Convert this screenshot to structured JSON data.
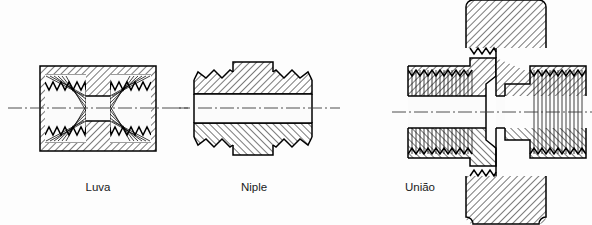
{
  "figure": {
    "background_color": "#fdfdfd",
    "line_color": "#000000",
    "centerline_color": "#3a3a3a",
    "width": 592,
    "height": 225
  },
  "items": [
    {
      "id": "luva",
      "label": "Luva",
      "label_x": 98,
      "label_y": 191,
      "kind": "coupling",
      "description": "Cross-sectioned rectangular coupling with internal threads at both ends",
      "body": {
        "x": 40,
        "y": 66,
        "width": 116,
        "height": 85
      },
      "centerline_y": 108,
      "bore": {
        "x": 84,
        "y": 96,
        "width": 28,
        "height": 25
      },
      "thread": {
        "type": "internal",
        "teeth": 9,
        "tooth_pitch": 8.2,
        "tooth_depth": 6.5,
        "left_band": {
          "x": 45,
          "y": 74,
          "width": 41,
          "height": 69
        },
        "right_band": {
          "x": 110,
          "y": 74,
          "width": 41,
          "height": 69
        }
      }
    },
    {
      "id": "niple",
      "label": "Niple",
      "label_x": 254,
      "label_y": 191,
      "kind": "nipple",
      "description": "Double-ended male nipple, external threads both ends, raised flat centre band",
      "centerline_y": 108,
      "body": {
        "x": 194,
        "y": 66,
        "width": 118,
        "height": 85
      },
      "bore": {
        "x": 194,
        "y": 94,
        "width": 118,
        "height": 29
      },
      "collar": {
        "x": 233,
        "y": 62,
        "width": 40,
        "height": 93
      },
      "thread": {
        "type": "external",
        "teeth": 10,
        "tooth_pitch": 7.4,
        "tooth_depth": 6.0
      }
    },
    {
      "id": "uniao",
      "label": "União",
      "label_x": 420,
      "label_y": 191,
      "kind": "union",
      "description": "Three-piece union: two threaded tailpieces joined by a central hexagon nut clipped top and bottom",
      "centerline_y": 112,
      "left_tail": {
        "x": 408,
        "y": 58,
        "width": 96,
        "height": 108
      },
      "right_tail": {
        "x": 490,
        "y": 58,
        "width": 96,
        "height": 108
      },
      "nut_top": {
        "x": 466,
        "y": 0,
        "width": 80,
        "height": 48,
        "corner_radius": 7
      },
      "nut_bottom": {
        "x": 466,
        "y": 176,
        "width": 80,
        "height": 48,
        "corner_radius": 7
      },
      "thread": {
        "type": "mixed",
        "left_lines": 22,
        "right_lines": 22
      }
    }
  ]
}
